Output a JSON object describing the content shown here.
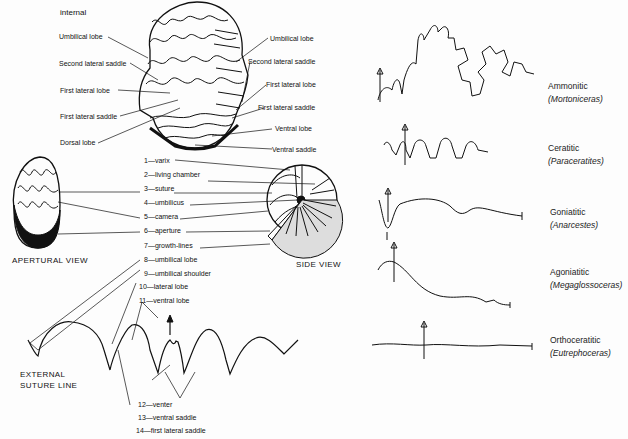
{
  "internal_view": {
    "heading": "internal",
    "left_labels": [
      "Umbilical lobe",
      "Second lateral saddle",
      "First lateral lobe",
      "First lateral saddle",
      "Dorsal lobe"
    ],
    "right_labels": [
      "Umbilical lobe",
      "Second lateral saddle",
      "First lateral lobe",
      "First lateral saddle",
      "Ventral lobe",
      "Ventral saddle"
    ]
  },
  "views": {
    "apertural": "APERTURAL VIEW",
    "side": "SIDE VIEW",
    "suture": [
      "EXTERNAL",
      "SUTURE LINE"
    ]
  },
  "numbered_labels": [
    "1—varix",
    "2—living chamber",
    "3—suture",
    "4—umbilicus",
    "5—camera",
    "6—aperture",
    "7—growth-lines",
    "8—umbilical lobe",
    "9—umbilical shoulder",
    "10—lateral lobe",
    "11—ventral lobe",
    "12—venter",
    "13—ventral saddle",
    "14—first lateral saddle"
  ],
  "suture_types": [
    {
      "name": "Ammonitic",
      "genus": "(Mortoniceras)"
    },
    {
      "name": "Ceratitic",
      "genus": "(Paraceratites)"
    },
    {
      "name": "Goniatitic",
      "genus": "(Anarcestes)"
    },
    {
      "name": "Agoniatitic",
      "genus": "(Megaglossoceras)"
    },
    {
      "name": "Orthoceratitic",
      "genus": "(Eutrephoceras)"
    }
  ]
}
